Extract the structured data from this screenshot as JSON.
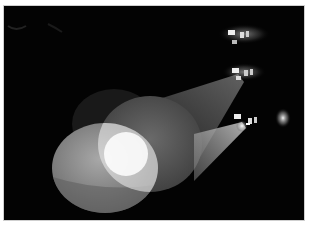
{
  "image": {
    "alt": "Three stage spotlights projecting overlapping elliptical beams of light onto a dark floor",
    "subject": "stage spotlights",
    "frame": {
      "x": 4,
      "y": 6,
      "width": 300,
      "height": 214
    },
    "colors": {
      "page_background": "#ffffff",
      "photo_background": "#030303",
      "frame_border": "#cfcfcf",
      "beam_light": "#9a9a9a",
      "overlap_highlight": "#f4f4f4"
    },
    "elements": [
      {
        "name": "spotlight-top",
        "position": [
          232,
          32
        ]
      },
      {
        "name": "spotlight-middle",
        "position": [
          236,
          68
        ]
      },
      {
        "name": "spotlight-bottom",
        "position": [
          238,
          118
        ]
      },
      {
        "name": "light-pool-left",
        "shape": "ellipse"
      },
      {
        "name": "light-pool-middle",
        "shape": "ellipse"
      },
      {
        "name": "light-pool-back",
        "shape": "ellipse"
      },
      {
        "name": "overlap-highlight",
        "shape": "lens"
      }
    ]
  }
}
